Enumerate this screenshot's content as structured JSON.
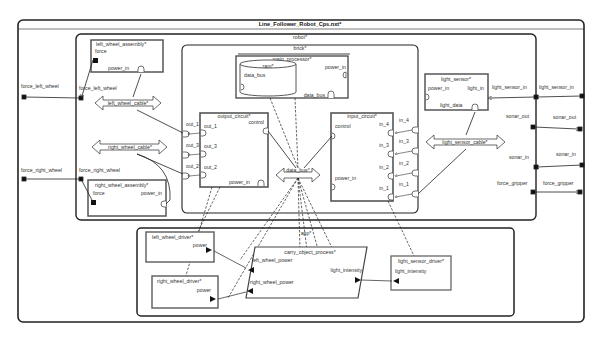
{
  "diagram": {
    "title": "Line_Follower_Robot_Cps.nxt*",
    "robot": {
      "title": "robot*",
      "ports_outer": {
        "force_left_wheel": "force_left_wheel",
        "force_right_wheel": "force_right_wheel",
        "light_sensor_in": "light_sensor_in",
        "sonar_out": "sonar_out",
        "sonar_in": "sonar_in",
        "force_gripper": "force_gripper"
      },
      "left_wheel_assembly": {
        "title": "left_wheel_assembly*",
        "force": "force",
        "power_in": "power_in"
      },
      "right_wheel_assembly": {
        "title": "right_wheel_assembly*",
        "force": "force",
        "power_in": "power_in"
      },
      "left_wheel_cable": "left_wheel_cable*",
      "right_wheel_cable": "right_wheel_cable*",
      "light_sensor": {
        "title": "light_sensor*",
        "power_in": "power_in",
        "light_in": "light_in",
        "light_data": "light_data"
      },
      "light_sensor_cable": "light_sensor_cable*",
      "brick": {
        "title": "brick*",
        "main_processor": {
          "title": "main_processor*",
          "power_in": "power_in",
          "data_bus": "data_bus"
        },
        "ram": {
          "title": "ram*",
          "data_bus": "data_bus"
        },
        "output_circuit": {
          "title": "output_circuit*",
          "out_1": "out_1",
          "out_3": "out_3",
          "out_2": "out_2",
          "control": "control",
          "power_in": "power_in"
        },
        "input_circuit": {
          "title": "input_circuit*",
          "control": "control",
          "power_in": "power_in",
          "in_4": "in_4",
          "in_3": "in_3",
          "in_2": "in_2",
          "in_1": "in_1"
        },
        "data_bus": "data_bus*",
        "ports": {
          "out_1": "out_1",
          "out_3": "out_3",
          "out_2": "out_2",
          "in_4": "in_4",
          "in_3": "in_3",
          "in_2": "in_2",
          "in_1": "in_1"
        }
      }
    },
    "app": {
      "title": "app*",
      "left_wheel_driver": {
        "title": "left_wheel_driver*",
        "power": "power"
      },
      "right_wheel_driver": {
        "title": "right_wheel_driver*",
        "power": "power"
      },
      "carry_object_process": {
        "title": "carry_object_process*",
        "left_wheel_power": "left_wheel_power",
        "right_wheel_power": "right_wheel_power",
        "light_intensity": "light_intensity"
      },
      "light_sensor_driver": {
        "title": "light_sensor_driver*",
        "light_intensity": "light_intensity"
      }
    },
    "colors": {
      "line": "#222222",
      "background": "#ffffff",
      "component_border": "#555555"
    }
  }
}
